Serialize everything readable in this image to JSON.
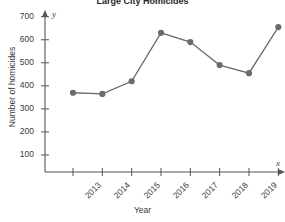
{
  "chart_data": {
    "type": "line",
    "title": "Large City Homicides",
    "xlabel": "Year",
    "ylabel": "Number of homicides",
    "categories": [
      "2013",
      "2014",
      "2015",
      "2016",
      "2017",
      "2018",
      "2019",
      "2020"
    ],
    "values": [
      370,
      365,
      420,
      630,
      590,
      490,
      455,
      655
    ],
    "x_axis_name": "x",
    "y_axis_name": "y",
    "yticks": [
      100,
      200,
      300,
      400,
      500,
      600,
      700
    ],
    "ylim": [
      0,
      740
    ],
    "xlim": [
      2012.5,
      2020.6
    ],
    "grid": false,
    "legend": false,
    "marker": "circle",
    "series_color": "#6b6b6b",
    "axis_color": "#555555",
    "text_color": "#3a3a3a"
  }
}
